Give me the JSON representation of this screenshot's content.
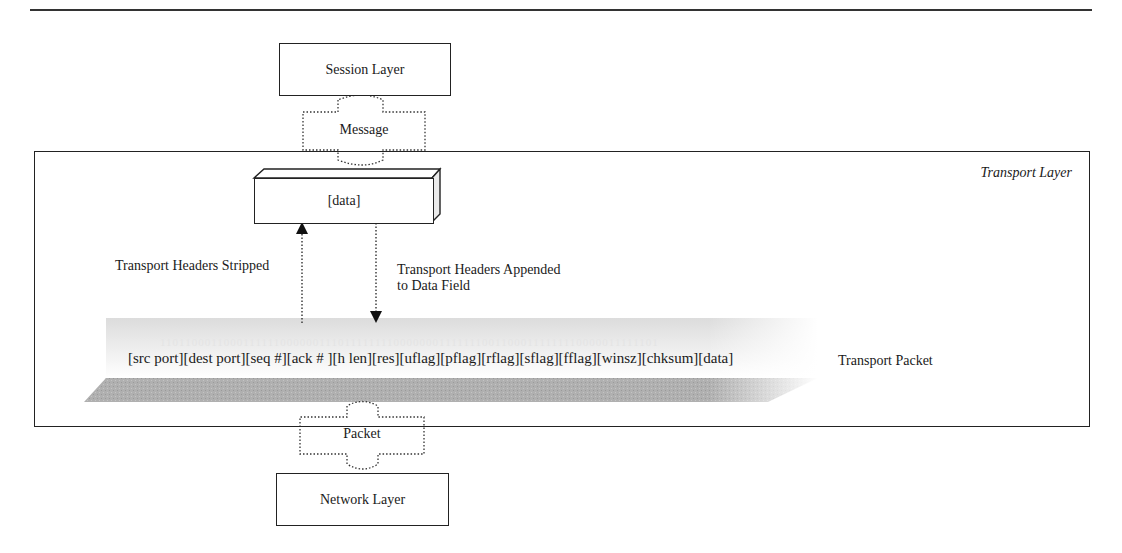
{
  "diagram": {
    "title_rule": true,
    "session_layer": {
      "label": "Session Layer"
    },
    "message_arrow": {
      "label": "Message"
    },
    "transport_layer": {
      "label": "Transport Layer",
      "data_block": {
        "label": "[data]"
      },
      "stripped": {
        "label": "Transport Headers Stripped"
      },
      "appended": {
        "line1": "Transport Headers Appended",
        "line2": "to Data Field"
      },
      "packet": {
        "fields": "[src port][dest port][seq #][ack # ][h len][res][uflag][pflag][rflag][sflag][fflag][winsz][chksum][data]",
        "label": "Transport Packet",
        "binary_watermark": "1101100011000111111000000111011111111000000011111110011000111111110000011111101"
      }
    },
    "packet_arrow": {
      "label": "Packet"
    },
    "network_layer": {
      "label": "Network Layer"
    }
  },
  "colors": {
    "line": "#222222",
    "packet_shade": "#a8a8a8",
    "packet_light": "#ececec"
  }
}
